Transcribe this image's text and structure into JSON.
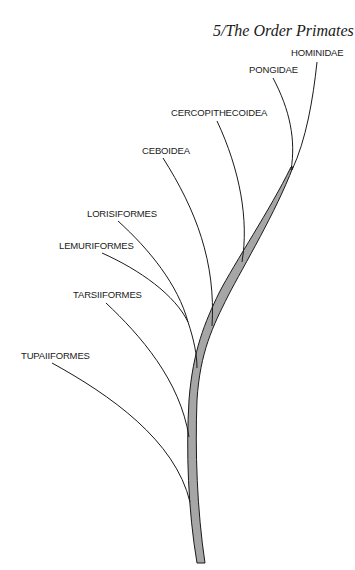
{
  "page": {
    "header": "5/The Order Primates"
  },
  "diagram": {
    "type": "phylogenetic-tree",
    "colors": {
      "trunk_fill": "#a6a6a6",
      "line": "#1a1a1a",
      "background": "#ffffff"
    },
    "taxa": [
      {
        "id": "hominidae",
        "label": "HOMINIDAE"
      },
      {
        "id": "pongidae",
        "label": "PONGIDAE"
      },
      {
        "id": "cercopithecoidea",
        "label": "CERCOPITHECOIDEA"
      },
      {
        "id": "ceboidea",
        "label": "CEBOIDEA"
      },
      {
        "id": "lorisiformes",
        "label": "LORISIFORMES"
      },
      {
        "id": "lemuriformes",
        "label": "LEMURIFORMES"
      },
      {
        "id": "tarsiiformes",
        "label": "TARSIIFORMES"
      },
      {
        "id": "tupaiiformes",
        "label": "TUPAIIFORMES"
      }
    ]
  }
}
